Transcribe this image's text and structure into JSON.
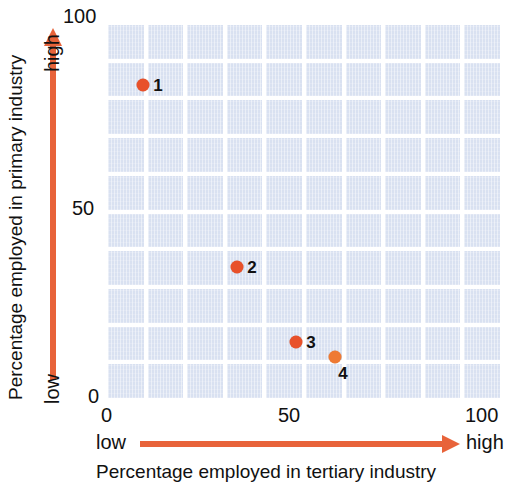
{
  "chart_data": {
    "type": "scatter",
    "title": "",
    "xlabel": "Percentage employed in tertiary industry",
    "ylabel": "Percentage employed in primary industry",
    "xlim": [
      0,
      100
    ],
    "ylim": [
      0,
      100
    ],
    "xticks": [
      "0",
      "50",
      "100"
    ],
    "xtick_values": [
      0,
      50,
      100
    ],
    "yticks": [
      "0",
      "50",
      "100"
    ],
    "ytick_values": [
      0,
      50,
      100
    ],
    "grid": true,
    "grid_columns": 10,
    "grid_rows": 10,
    "legend": "none",
    "direction_labels": {
      "x_low": "low",
      "x_high": "high",
      "y_low": "low",
      "y_high": "high"
    },
    "points": [
      {
        "label": "1",
        "x": 9,
        "y": 84,
        "color": "#e8512a"
      },
      {
        "label": "2",
        "x": 33,
        "y": 35,
        "color": "#e8512a"
      },
      {
        "label": "3",
        "x": 48,
        "y": 15,
        "color": "#e8512a"
      },
      {
        "label": "4",
        "x": 58,
        "y": 11,
        "color": "#ef7a33"
      }
    ]
  },
  "colors": {
    "marker": "#e8512a",
    "marker_alt": "#ef7a33",
    "arrow": "#e8633a",
    "grid_cell": "#d9e1f1",
    "grid_line": "#ffffff",
    "text": "#111111",
    "background": "#ffffff"
  },
  "axes": {
    "y_tick_100": "100",
    "y_tick_50": "50",
    "y_tick_0": "0",
    "x_tick_0": "0",
    "x_tick_50": "50",
    "x_tick_100": "100",
    "y_high": "high",
    "y_low": "low",
    "x_low": "low",
    "x_high": "high",
    "y_title": "Percentage employed in primary industry",
    "x_title": "Percentage employed in tertiary industry"
  }
}
